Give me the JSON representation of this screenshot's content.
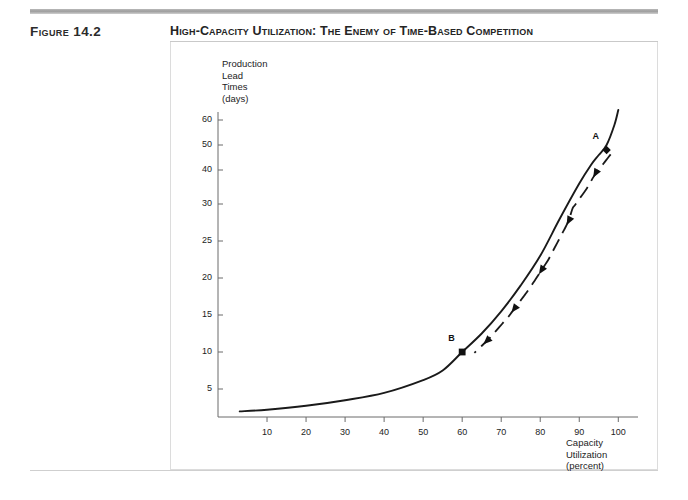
{
  "header": {
    "figure_label": "Figure 14.2",
    "title": "High-Capacity Utilization: The Enemy of Time-Based Competition"
  },
  "chart_data": {
    "type": "line",
    "title": "High-Capacity Utilization: The Enemy of Time-Based Competition",
    "xlabel": "Capacity Utilization (percent)",
    "ylabel": "Production Lead Times (days)",
    "ylabel_lines": [
      "Production",
      "Lead",
      "Times",
      "(days)"
    ],
    "xlabel_lines": [
      "Capacity",
      "Utilization",
      "(percent)"
    ],
    "grid": false,
    "legend": null,
    "xlim": [
      0,
      103
    ],
    "ylim": [
      0,
      65
    ],
    "xticks": [
      10,
      20,
      30,
      40,
      50,
      60,
      70,
      80,
      90,
      100
    ],
    "yticks": [
      5,
      10,
      15,
      20,
      25,
      30,
      40,
      50,
      60
    ],
    "ytick_note": "non-linear spacing: even steps 5-30, then 40, 50, 60",
    "series": [
      {
        "name": "Production lead time vs capacity utilization",
        "style": "solid-curve",
        "color": "#1a1a1a",
        "x": [
          3,
          10,
          20,
          30,
          40,
          50,
          55,
          60,
          65,
          70,
          75,
          80,
          85,
          90,
          93,
          95,
          97,
          99,
          100
        ],
        "y": [
          1.0,
          1.3,
          2.0,
          3.0,
          4.3,
          6.2,
          7.5,
          10.0,
          12.5,
          15.5,
          19.0,
          23.0,
          28.0,
          36.0,
          42.0,
          46.0,
          50.0,
          58.0,
          64.0
        ]
      },
      {
        "name": "Improvement arrow A to B",
        "style": "dashed-arrow",
        "color": "#1a1a1a",
        "direction": "from A to B",
        "arrowhead_count": 5
      }
    ],
    "annotations": [
      {
        "label": "A",
        "x": 97,
        "y": 48,
        "marker": "diamond",
        "note": "high utilization, long lead time"
      },
      {
        "label": "B",
        "x": 60,
        "y": 10,
        "marker": "square",
        "note": "lower utilization, short lead time"
      }
    ]
  }
}
